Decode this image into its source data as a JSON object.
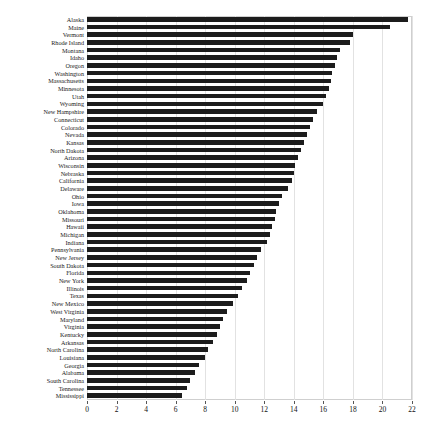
{
  "chart": {
    "type": "barh",
    "title": "",
    "xlabel": "",
    "ylabel": "",
    "background": "#ffffff",
    "bar_color": "#1c1c1c",
    "grid_color": "#e2e2e2",
    "grid": true,
    "legend": false
  },
  "chart_data": {
    "type": "bar",
    "orientation": "horizontal",
    "title": "",
    "xlabel": "",
    "ylabel": "",
    "xlim": [
      0,
      22
    ],
    "ylim": [
      0,
      50
    ],
    "grid": true,
    "legend_position": "none",
    "xticks": [
      0,
      2,
      4,
      6,
      8,
      10,
      12,
      14,
      16,
      18,
      20,
      22
    ],
    "xticklabels": [
      "0",
      "2",
      "4",
      "6",
      "8",
      "10",
      "12",
      "14",
      "16",
      "18",
      "20",
      "22"
    ],
    "categories": [
      "Alaska",
      "Maine",
      "Vermont",
      "Rhode Island",
      "Montana",
      "Idaho",
      "Oregon",
      "Washington",
      "Massachusetts",
      "Minnesota",
      "Utah",
      "Wyoming",
      "New Hampshire",
      "Connecticut",
      "Colorado",
      "Nevada",
      "Kansas",
      "North Dakota",
      "Arizona",
      "Wisconsin",
      "Nebraska",
      "California",
      "Delaware",
      "Ohio",
      "Iowa",
      "Oklahoma",
      "Missouri",
      "Hawaii",
      "Michigan",
      "Indiana",
      "Pennsylvania",
      "New Jersey",
      "South Dakota",
      "Florida",
      "New York",
      "Illinois",
      "Texas",
      "New Mexico",
      "West Virginia",
      "Maryland",
      "Virginia",
      "Kentucky",
      "Arkansas",
      "North Carolina",
      "Louisiana",
      "Georgia",
      "Alabama",
      "South Carolina",
      "Tennessee",
      "Mississippi"
    ],
    "values": [
      21.7,
      20.5,
      18.0,
      17.8,
      17.1,
      16.9,
      16.8,
      16.6,
      16.5,
      16.4,
      16.2,
      16.0,
      15.6,
      15.3,
      15.1,
      14.9,
      14.7,
      14.5,
      14.3,
      14.1,
      14.0,
      13.9,
      13.6,
      13.2,
      13.0,
      12.8,
      12.7,
      12.5,
      12.4,
      12.2,
      11.8,
      11.5,
      11.3,
      11.0,
      10.8,
      10.5,
      10.2,
      9.9,
      9.5,
      9.2,
      9.0,
      8.8,
      8.5,
      8.2,
      8.0,
      7.6,
      7.3,
      7.0,
      6.8,
      6.4
    ]
  }
}
